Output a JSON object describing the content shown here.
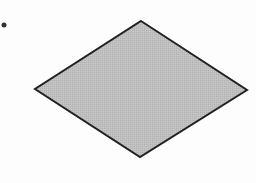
{
  "diagram": {
    "type": "flowchart-fragment",
    "shapes": [
      {
        "kind": "bullet-dot",
        "cx": 4,
        "cy": 25,
        "r": 2.5,
        "fill": "#333333"
      },
      {
        "kind": "diamond",
        "role": "decision",
        "points": {
          "top": [
            141,
            21
          ],
          "right": [
            247,
            90
          ],
          "bottom": [
            140,
            157
          ],
          "left": [
            35,
            89
          ]
        },
        "fill": "#bdbdbd",
        "stroke": "#222222",
        "stroke_width": 2,
        "label": ""
      }
    ]
  }
}
